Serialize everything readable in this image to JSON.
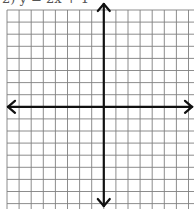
{
  "problem": {
    "label": "2) y = 2x + 1",
    "note": "top text partially cropped in screenshot"
  },
  "grid": {
    "cells_x": 16,
    "cells_y": 16,
    "cell_size_px": 12.1,
    "origin_px": [
      7,
      10
    ],
    "line_color": "#808080",
    "axis_color": "#111111"
  },
  "axes": {
    "x_axis_row": 8,
    "y_axis_col": 8,
    "arrows": [
      "left",
      "right",
      "up",
      "down"
    ]
  }
}
